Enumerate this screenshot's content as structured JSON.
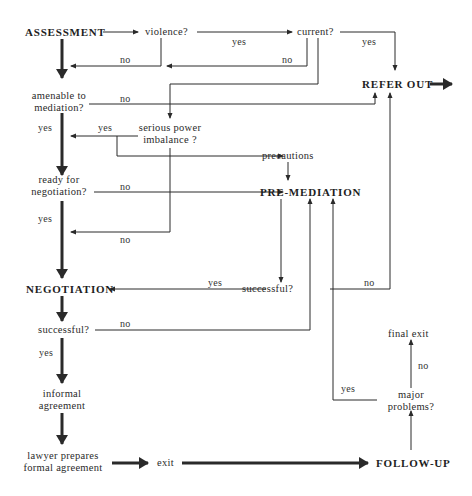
{
  "nodes": {
    "assessment": "ASSESSMENT",
    "violence": "violence?",
    "current": "current?",
    "refer_out": "REFER OUT",
    "amenable_1": "amenable to",
    "amenable_2": "mediation?",
    "power_1": "serious power",
    "power_2": "imbalance ?",
    "precautions": "precautions",
    "ready_1": "ready for",
    "ready_2": "negotiation?",
    "pre_mediation": "PRE-MEDIATION",
    "negotiation": "NEGOTIATION",
    "premed_successful": "successful?",
    "neg_successful": "successful?",
    "final_exit": "final exit",
    "major_1": "major",
    "major_2": "problems?",
    "informal_1": "informal",
    "informal_2": "agreement",
    "lawyer_1": "lawyer prepares",
    "lawyer_2": "formal agreement",
    "exit": "exit",
    "follow_up": "FOLLOW-UP"
  },
  "edges": {
    "violence_yes": "yes",
    "violence_no": "no",
    "current_yes": "yes",
    "current_no": "no",
    "amenable_no": "no",
    "amenable_yes": "yes",
    "power_yes": "yes",
    "ready_no": "no",
    "ready_yes": "yes",
    "power_no": "no",
    "premed_yes": "yes",
    "premed_no": "no",
    "neg_no": "no",
    "neg_yes": "yes",
    "major_no": "no",
    "major_yes": "yes"
  }
}
